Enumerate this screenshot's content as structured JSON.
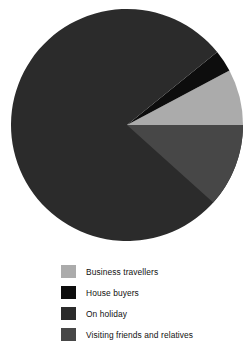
{
  "chart_data": {
    "type": "pie",
    "title": "",
    "subtitle": "",
    "xlabel": "",
    "ylabel": "",
    "grid": false,
    "legend_position": "bottom-left",
    "categories": [
      "Business travellers",
      "House buyers",
      "On holiday",
      "Visiting friends and relatives"
    ],
    "values": [
      7.5,
      3.0,
      78.0,
      11.5
    ],
    "colors": [
      "#ababab",
      "#0d0d0d",
      "#2b2b2b",
      "#474747"
    ],
    "slices": [
      {
        "label": "Business travellers",
        "value": 7.5,
        "color": "#ababab",
        "start_angle_deg": -28,
        "end_angle_deg": 0
      },
      {
        "label": "House buyers",
        "value": 3.0,
        "color": "#0d0d0d",
        "start_angle_deg": -39,
        "end_angle_deg": -28
      },
      {
        "label": "On holiday",
        "value": 78.0,
        "color": "#2b2b2b",
        "start_angle_deg": -360,
        "end_angle_deg": -39
      },
      {
        "label": "Visiting friends and relatives",
        "value": 11.5,
        "color": "#474747",
        "start_angle_deg": 0,
        "end_angle_deg": 42
      }
    ],
    "geometry": {
      "center_x": 127,
      "center_y": 125,
      "radius": 116
    }
  },
  "legend": {
    "items": [
      {
        "label": "Business travellers",
        "color": "#ababab"
      },
      {
        "label": "House buyers",
        "color": "#0d0d0d"
      },
      {
        "label": "On holiday",
        "color": "#2b2b2b"
      },
      {
        "label": "Visiting friends and relatives",
        "color": "#474747"
      }
    ]
  }
}
